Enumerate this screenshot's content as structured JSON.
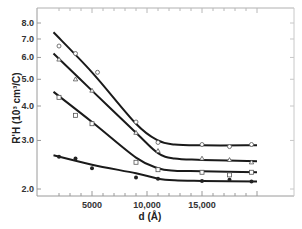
{
  "chart_data": {
    "type": "line",
    "title": "",
    "xlabel": "d (Å)",
    "ylabel": "R'H (10³ cm³/C)",
    "yscale": "log",
    "xlim": [
      1500,
      20000
    ],
    "ylim": [
      1.95,
      8.8
    ],
    "grid": false,
    "legend": null,
    "x_ticks": [
      5000,
      10000,
      15000
    ],
    "x_tick_labels": [
      "5000",
      "10,000",
      "15,000"
    ],
    "y_ticks": [
      2.0,
      3.0,
      4.0,
      5.0,
      6.0,
      7.0,
      8.0
    ],
    "y_tick_labels": [
      "2.0",
      "3.0",
      "4.0",
      "5.0",
      "6.0",
      "7.0",
      "8.0"
    ],
    "series": [
      {
        "name": "curve-1",
        "marker": "open-circle",
        "fit": [
          [
            1500,
            7.4
          ],
          [
            5000,
            5.3
          ],
          [
            9000,
            3.45
          ],
          [
            11000,
            3.0
          ],
          [
            12500,
            2.9
          ],
          [
            15000,
            2.88
          ],
          [
            20000,
            2.88
          ]
        ],
        "points": [
          [
            2000,
            6.6
          ],
          [
            3500,
            6.2
          ],
          [
            5500,
            5.3
          ],
          [
            9000,
            3.5
          ],
          [
            11000,
            2.95
          ],
          [
            15000,
            2.9
          ],
          [
            17500,
            2.85
          ],
          [
            19500,
            2.9
          ]
        ]
      },
      {
        "name": "curve-2",
        "marker": "open-triangle",
        "fit": [
          [
            1500,
            6.2
          ],
          [
            5000,
            4.55
          ],
          [
            9000,
            3.2
          ],
          [
            11000,
            2.7
          ],
          [
            12500,
            2.58
          ],
          [
            15000,
            2.55
          ],
          [
            20000,
            2.52
          ]
        ],
        "points": [
          [
            2000,
            5.9
          ],
          [
            3500,
            5.0
          ],
          [
            5000,
            4.55
          ],
          [
            9000,
            3.2
          ],
          [
            11000,
            2.75
          ],
          [
            15000,
            2.58
          ],
          [
            17500,
            2.55
          ],
          [
            19500,
            2.5
          ]
        ]
      },
      {
        "name": "curve-3",
        "marker": "open-square",
        "fit": [
          [
            1500,
            4.5
          ],
          [
            5000,
            3.5
          ],
          [
            9000,
            2.6
          ],
          [
            11000,
            2.38
          ],
          [
            12500,
            2.33
          ],
          [
            15000,
            2.32
          ],
          [
            20000,
            2.3
          ]
        ],
        "points": [
          [
            2000,
            4.3
          ],
          [
            3500,
            3.7
          ],
          [
            5000,
            3.45
          ],
          [
            9000,
            2.5
          ],
          [
            11000,
            2.35
          ],
          [
            15000,
            2.3
          ],
          [
            17500,
            2.25
          ],
          [
            19500,
            2.3
          ]
        ]
      },
      {
        "name": "curve-4",
        "marker": "filled-circle",
        "fit": [
          [
            1500,
            2.65
          ],
          [
            5000,
            2.45
          ],
          [
            9000,
            2.28
          ],
          [
            11000,
            2.18
          ],
          [
            12500,
            2.15
          ],
          [
            15000,
            2.14
          ],
          [
            20000,
            2.13
          ]
        ],
        "points": [
          [
            2000,
            2.62
          ],
          [
            3500,
            2.58
          ],
          [
            5000,
            2.38
          ],
          [
            9000,
            2.2
          ],
          [
            11000,
            2.18
          ],
          [
            15000,
            2.14
          ],
          [
            17500,
            2.16
          ],
          [
            19500,
            2.13
          ]
        ]
      }
    ]
  },
  "colors": {
    "line": "#1a1a1a",
    "axis": "#9a9a9a",
    "marker": "#555555"
  }
}
